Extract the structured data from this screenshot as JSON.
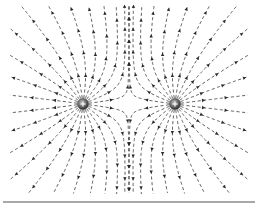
{
  "diagram": {
    "title": "",
    "charges": [
      {
        "id": "left",
        "sign": "+",
        "x": 83,
        "y": 104,
        "r": 5.5
      },
      {
        "id": "right",
        "sign": "+",
        "x": 175,
        "y": 104,
        "r": 5.5
      }
    ],
    "field_lines_per_charge": 24,
    "colors": {
      "line": "#3a3a3a",
      "arrow": "#2a2a2a",
      "charge_fill": "#6a6a6a",
      "charge_sign": "#f4f4f4",
      "rule": "#555555",
      "background": "#ffffff"
    },
    "baseline": {
      "x1": 3,
      "x2": 255,
      "y": 202
    }
  }
}
